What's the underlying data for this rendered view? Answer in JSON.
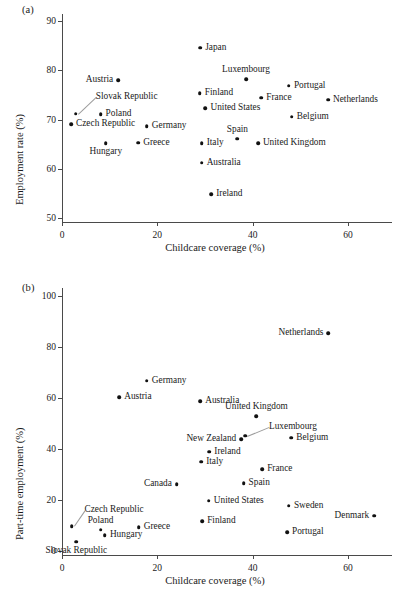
{
  "figure": {
    "panel_a_tag": "(a)",
    "panel_b_tag": "(b)"
  },
  "chart_data": [
    {
      "id": "panel-a",
      "type": "scatter",
      "title": "",
      "xlabel": "Childcare coverage (%)",
      "ylabel": "Employment rate (%)",
      "xlim": [
        0,
        68
      ],
      "ylim": [
        50,
        92
      ],
      "xticks": [
        0,
        20,
        40,
        60
      ],
      "yticks": [
        50,
        60,
        70,
        80,
        90
      ],
      "xtick_labels": [
        "0",
        "20",
        "40",
        "60"
      ],
      "ytick_labels": [
        "50",
        "60",
        "70",
        "80",
        "90"
      ],
      "grid": false,
      "legend": "none",
      "points": [
        {
          "label": "Japan",
          "x": 29.0,
          "y": 84.6,
          "pos": "right"
        },
        {
          "label": "Luxembourg",
          "x": 38.6,
          "y": 78.2,
          "pos": "above"
        },
        {
          "label": "Austria",
          "x": 11.8,
          "y": 78.0,
          "pos": "left"
        },
        {
          "label": "Portugal",
          "x": 47.6,
          "y": 76.9,
          "pos": "right"
        },
        {
          "label": "Finland",
          "x": 28.9,
          "y": 75.3,
          "pos": "right"
        },
        {
          "label": "France",
          "x": 41.8,
          "y": 74.4,
          "pos": "right"
        },
        {
          "label": "Netherlands",
          "x": 55.8,
          "y": 74.0,
          "pos": "right"
        },
        {
          "label": "United States",
          "x": 30.1,
          "y": 72.3,
          "pos": "right"
        },
        {
          "label": "Slovak Republic",
          "x": 2.9,
          "y": 71.2,
          "pos": "leader"
        },
        {
          "label": "Poland",
          "x": 8.1,
          "y": 71.1,
          "pos": "right"
        },
        {
          "label": "Belgium",
          "x": 48.2,
          "y": 70.6,
          "pos": "right"
        },
        {
          "label": "Czech Republic",
          "x": 1.9,
          "y": 69.1,
          "pos": "right"
        },
        {
          "label": "Germany",
          "x": 17.8,
          "y": 68.6,
          "pos": "right"
        },
        {
          "label": "Spain",
          "x": 36.8,
          "y": 66.1,
          "pos": "above"
        },
        {
          "label": "Greece",
          "x": 16.0,
          "y": 65.3,
          "pos": "right"
        },
        {
          "label": "Italy",
          "x": 29.3,
          "y": 65.2,
          "pos": "right"
        },
        {
          "label": "United Kingdom",
          "x": 41.1,
          "y": 65.2,
          "pos": "right"
        },
        {
          "label": "Hungary",
          "x": 9.2,
          "y": 65.2,
          "pos": "below"
        },
        {
          "label": "Australia",
          "x": 29.3,
          "y": 61.2,
          "pos": "right"
        },
        {
          "label": "Ireland",
          "x": 31.3,
          "y": 54.8,
          "pos": "right"
        }
      ]
    },
    {
      "id": "panel-b",
      "type": "scatter",
      "title": "",
      "xlabel": "Childcare coverage (%)",
      "ylabel": "Part-time employment (%)",
      "xlim": [
        0,
        68
      ],
      "ylim": [
        0,
        105
      ],
      "xticks": [
        0,
        20,
        40,
        60
      ],
      "yticks": [
        0,
        20,
        40,
        60,
        80,
        100
      ],
      "xtick_labels": [
        "0",
        "20",
        "40",
        "60"
      ],
      "ytick_labels": [
        "0",
        "20",
        "40",
        "60",
        "80",
        "100"
      ],
      "grid": false,
      "legend": "none",
      "points": [
        {
          "label": "Netherlands",
          "x": 55.9,
          "y": 85.3,
          "pos": "left"
        },
        {
          "label": "Germany",
          "x": 17.8,
          "y": 66.8,
          "pos": "right"
        },
        {
          "label": "Austria",
          "x": 12.0,
          "y": 60.4,
          "pos": "right"
        },
        {
          "label": "Australia",
          "x": 29.0,
          "y": 58.8,
          "pos": "right"
        },
        {
          "label": "United Kingdom",
          "x": 40.8,
          "y": 52.8,
          "pos": "above"
        },
        {
          "label": "Luxembourg",
          "x": 38.4,
          "y": 45.2,
          "pos": "leader"
        },
        {
          "label": "New Zealand",
          "x": 37.6,
          "y": 43.9,
          "pos": "left"
        },
        {
          "label": "Belgium",
          "x": 48.1,
          "y": 44.4,
          "pos": "right"
        },
        {
          "label": "Ireland",
          "x": 30.9,
          "y": 38.9,
          "pos": "right"
        },
        {
          "label": "Italy",
          "x": 29.2,
          "y": 35.0,
          "pos": "right"
        },
        {
          "label": "France",
          "x": 42.0,
          "y": 32.0,
          "pos": "right"
        },
        {
          "label": "Spain",
          "x": 38.1,
          "y": 26.5,
          "pos": "right"
        },
        {
          "label": "Canada",
          "x": 24.1,
          "y": 26.2,
          "pos": "left"
        },
        {
          "label": "United States",
          "x": 30.8,
          "y": 19.8,
          "pos": "right"
        },
        {
          "label": "Sweden",
          "x": 47.6,
          "y": 17.8,
          "pos": "right"
        },
        {
          "label": "Denmark",
          "x": 65.5,
          "y": 13.9,
          "pos": "left"
        },
        {
          "label": "Finland",
          "x": 29.4,
          "y": 11.6,
          "pos": "right"
        },
        {
          "label": "Czech Republic",
          "x": 2.0,
          "y": 9.8,
          "pos": "leader"
        },
        {
          "label": "Greece",
          "x": 16.1,
          "y": 9.3,
          "pos": "right"
        },
        {
          "label": "Poland",
          "x": 8.1,
          "y": 8.3,
          "pos": "above"
        },
        {
          "label": "Portugal",
          "x": 47.2,
          "y": 7.3,
          "pos": "right"
        },
        {
          "label": "Hungary",
          "x": 9.0,
          "y": 6.2,
          "pos": "right"
        },
        {
          "label": "Slovak Republic",
          "x": 3.0,
          "y": 3.6,
          "pos": "below"
        }
      ]
    }
  ]
}
